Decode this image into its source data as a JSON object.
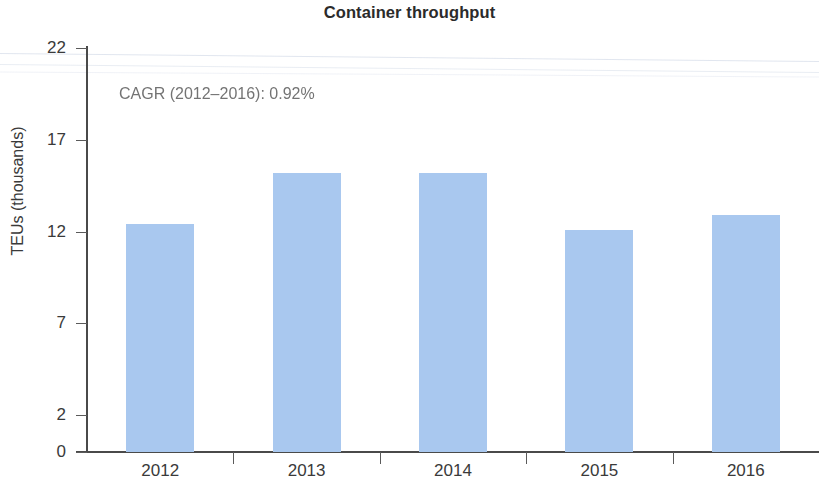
{
  "chart_data": {
    "type": "bar",
    "title": "Container throughput",
    "xlabel": "",
    "ylabel": "TEUs (thousands)",
    "categories": [
      "2012",
      "2013",
      "2014",
      "2015",
      "2016"
    ],
    "values": [
      12.4,
      15.2,
      15.2,
      12.1,
      12.9
    ],
    "series": [
      {
        "name": "Container throughput",
        "values": [
          12.4,
          15.2,
          15.2,
          12.1,
          12.9
        ]
      }
    ],
    "ylim": [
      0,
      22
    ],
    "yticks": [
      0,
      2,
      7,
      12,
      17,
      22
    ],
    "ytick_labels": [
      "0",
      "2",
      "7",
      "12",
      "17",
      "22"
    ],
    "grid": false,
    "legend": false,
    "bar_color": "#a9c8ef",
    "annotations": [
      {
        "id": "cagr",
        "text": "CAGR (2012–2016): 0.92%"
      }
    ]
  },
  "axis": {
    "y_title": "TEUs (thousands)",
    "y_ticks": [
      {
        "label": "22",
        "value": 22
      },
      {
        "label": "17",
        "value": 17
      },
      {
        "label": "12",
        "value": 12
      },
      {
        "label": "7",
        "value": 7
      },
      {
        "label": "2",
        "value": 2
      },
      {
        "label": "0",
        "value": 0
      }
    ],
    "x_ticks": [
      {
        "label": "2012"
      },
      {
        "label": "2013"
      },
      {
        "label": "2014"
      },
      {
        "label": "2015"
      },
      {
        "label": "2016"
      }
    ]
  },
  "bars": [
    {
      "category": "2012",
      "value": 12.4
    },
    {
      "category": "2013",
      "value": 15.2
    },
    {
      "category": "2014",
      "value": 15.2
    },
    {
      "category": "2015",
      "value": 12.1
    },
    {
      "category": "2016",
      "value": 12.9
    }
  ]
}
